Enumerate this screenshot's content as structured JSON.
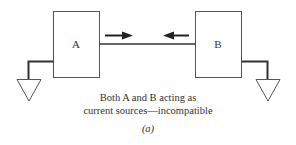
{
  "diagram": {
    "blocks": [
      {
        "id": "A",
        "label": "A"
      },
      {
        "id": "B",
        "label": "B"
      }
    ],
    "arrows": [
      {
        "from": "A",
        "direction": "right"
      },
      {
        "from": "B",
        "direction": "left"
      }
    ],
    "caption": {
      "line1": "Both A and B acting as",
      "line2": "current sources—incompatible",
      "sublabel": "(a)"
    },
    "colors": {
      "stroke": "#333333",
      "background": "#ffffff"
    }
  }
}
